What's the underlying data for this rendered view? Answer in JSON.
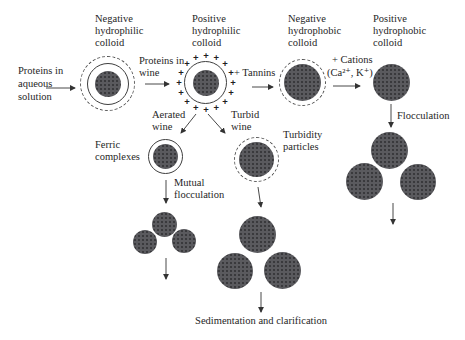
{
  "figure": {
    "source": {
      "label": "Proteins in\naqueous\nsolution"
    },
    "stages": {
      "negative_hydrophilic": {
        "label": "Negative\nhydrophilic\ncolloid"
      },
      "positive_hydrophilic": {
        "label": "Positive\nhydrophilic\ncolloid",
        "charge_symbol": "+",
        "charge_count": 16
      },
      "negative_hydrophobic": {
        "label": "Negative\nhydrophobic\ncolloid"
      },
      "positive_hydrophobic": {
        "label": "Positive\nhydrophobic\ncolloid"
      }
    },
    "transitions": {
      "proteins_in_wine": {
        "label": "Proteins in\nwine"
      },
      "tannins": {
        "label": "+ Tannins"
      },
      "cations": {
        "line1": "+ Cations",
        "line2": "(Ca²⁺, K⁺)"
      },
      "flocculation": {
        "label": "Flocculation"
      },
      "aerated_wine": {
        "label": "Aerated\nwine"
      },
      "turbid_wine": {
        "label": "Turbid\nwine"
      },
      "mutual_flocculation": {
        "label": "Mutual\nflocculation"
      }
    },
    "entities": {
      "ferric_complexes": {
        "label": "Ferric\ncomplexes"
      },
      "turbidity_particles": {
        "label": "Turbidity\nparticles"
      }
    },
    "outcome": {
      "label": "Sedimentation and clarification"
    },
    "colors": {
      "particle_fill": "#5a5a5e",
      "line": "#333333",
      "text": "#262626",
      "background": "#ffffff"
    }
  }
}
